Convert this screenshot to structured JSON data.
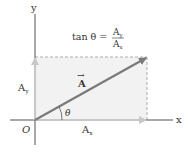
{
  "diagram": {
    "type": "vector-components",
    "axes": {
      "x_label": "x",
      "y_label": "y",
      "origin_label": "O"
    },
    "vector": {
      "name": "A",
      "label": "A",
      "arrow_accent": "→"
    },
    "components": {
      "x": {
        "label_base": "A",
        "label_sub": "x"
      },
      "y": {
        "label_base": "A",
        "label_sub": "y"
      }
    },
    "angle_label": "θ",
    "formula": {
      "lhs": "tan θ =",
      "numerator_base": "A",
      "numerator_sub": "y",
      "denominator_base": "A",
      "denominator_sub": "x"
    },
    "colors": {
      "vector": "#7a7a7a",
      "components": "#c8c8c8",
      "axes": "#555555",
      "shading": "#f2f2f2",
      "dashed": "#999999",
      "text": "#333333"
    }
  }
}
